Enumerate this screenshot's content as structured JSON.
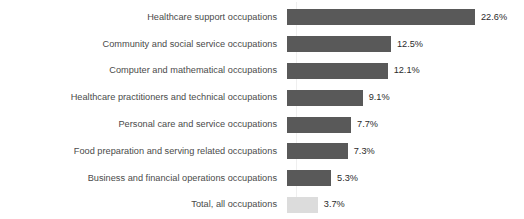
{
  "chart_data": {
    "type": "bar",
    "orientation": "horizontal",
    "title": "",
    "subtitle": "",
    "xlabel": "",
    "ylabel": "",
    "grid": false,
    "legend": null,
    "xlim": [
      0,
      22.6
    ],
    "value_suffix": "%",
    "colors": {
      "bar": "#595959",
      "bar_highlight": "#dcdcdc",
      "label_text": "#4a4a4a",
      "value_text": "#2b2b2b",
      "background": "#ffffff",
      "axis_line": "#efefef"
    },
    "categories": [
      "Healthcare support occupations",
      "Community and social service occupations",
      "Computer and mathematical occupations",
      "Healthcare practitioners and technical occupations",
      "Personal care and service occupations",
      "Food preparation and serving related occupations",
      "Business and financial operations occupations",
      "Total, all occupations"
    ],
    "values": [
      22.6,
      12.5,
      12.1,
      9.1,
      7.7,
      7.3,
      5.3,
      3.7
    ],
    "value_labels": [
      "22.6%",
      "12.5%",
      "12.1%",
      "9.1%",
      "7.7%",
      "7.3%",
      "5.3%",
      "3.7%"
    ],
    "bars": [
      {
        "category": "Healthcare support occupations",
        "value": 22.6,
        "label": "22.6%",
        "style": "dark"
      },
      {
        "category": "Community and social service occupations",
        "value": 12.5,
        "label": "12.5%",
        "style": "dark"
      },
      {
        "category": "Computer and mathematical occupations",
        "value": 12.1,
        "label": "12.1%",
        "style": "dark"
      },
      {
        "category": "Healthcare practitioners and technical occupations",
        "value": 9.1,
        "label": "9.1%",
        "style": "dark"
      },
      {
        "category": "Personal care and service occupations",
        "value": 7.7,
        "label": "7.7%",
        "style": "dark"
      },
      {
        "category": "Food preparation and serving related occupations",
        "value": 7.3,
        "label": "7.3%",
        "style": "dark"
      },
      {
        "category": "Business and financial operations occupations",
        "value": 5.3,
        "label": "5.3%",
        "style": "dark"
      },
      {
        "category": "Total, all occupations",
        "value": 3.7,
        "label": "3.7%",
        "style": "light"
      }
    ]
  }
}
